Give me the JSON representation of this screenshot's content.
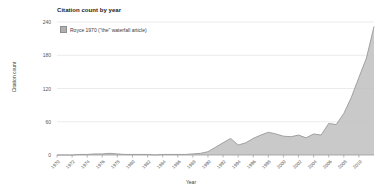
{
  "chart_data": {
    "type": "area",
    "title": "Citation count by year",
    "xlabel": "Year",
    "ylabel": "Citation count",
    "legend": [
      {
        "label": "Royce 1970 (\"the\" waterfall article)",
        "color": "#b9b9b9"
      }
    ],
    "legend_position": "top-left-inside",
    "grid": true,
    "xlim": [
      1970,
      2012
    ],
    "ylim": [
      0,
      240
    ],
    "yticks": [
      0,
      60,
      120,
      180,
      240
    ],
    "xticks": [
      1970,
      1972,
      1974,
      1976,
      1978,
      1980,
      1982,
      1984,
      1986,
      1988,
      1990,
      1992,
      1994,
      1996,
      1998,
      2000,
      2002,
      2004,
      2006,
      2008,
      2010
    ],
    "x": [
      1970,
      1971,
      1972,
      1973,
      1974,
      1975,
      1976,
      1977,
      1978,
      1979,
      1980,
      1981,
      1982,
      1983,
      1984,
      1985,
      1986,
      1987,
      1988,
      1989,
      1990,
      1991,
      1992,
      1993,
      1994,
      1995,
      1996,
      1997,
      1998,
      1999,
      2000,
      2001,
      2002,
      2003,
      2004,
      2005,
      2006,
      2007,
      2008,
      2009,
      2010,
      2011,
      2012
    ],
    "values": [
      0,
      0,
      0,
      1,
      1,
      2,
      2,
      3,
      2,
      1,
      1,
      1,
      1,
      0,
      1,
      1,
      1,
      1,
      2,
      3,
      6,
      14,
      22,
      30,
      18,
      22,
      30,
      36,
      41,
      38,
      34,
      33,
      36,
      31,
      38,
      36,
      57,
      55,
      75,
      104,
      140,
      175,
      232
    ],
    "series": [
      {
        "name": "Royce 1970 (\"the\" waterfall article)",
        "values": [
          0,
          0,
          0,
          1,
          1,
          2,
          2,
          3,
          2,
          1,
          1,
          1,
          1,
          0,
          1,
          1,
          1,
          1,
          2,
          3,
          6,
          14,
          22,
          30,
          18,
          22,
          30,
          36,
          41,
          38,
          34,
          33,
          36,
          31,
          38,
          36,
          57,
          55,
          75,
          104,
          140,
          175,
          232
        ],
        "color": "#b9b9b9"
      }
    ]
  },
  "colors": {
    "area_fill": "#bfbfbf",
    "area_stroke": "#8f8f8f",
    "grid": "#ebebeb",
    "axis": "#999999",
    "text": "#3a3a3a",
    "background": "#ffffff"
  }
}
